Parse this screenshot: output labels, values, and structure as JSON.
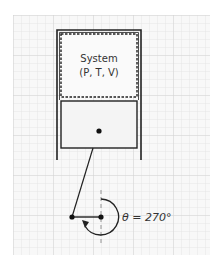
{
  "diagram": {
    "type": "piston-cylinder-crank",
    "system": {
      "title": "System",
      "properties": "(P, T, V)",
      "properties_list": [
        "P",
        "T",
        "V"
      ],
      "boundary_style": "dashed"
    },
    "crank": {
      "angle_label": "θ = 270°",
      "angle_degrees": 270,
      "rotation": "counterclockwise-arrow"
    },
    "colors": {
      "background": "#ffffff",
      "grid_paper": "#f7f7f7",
      "grid_line": "#d9d9d9",
      "stroke": "#222222",
      "piston_fill": "#f4f4f4"
    }
  }
}
